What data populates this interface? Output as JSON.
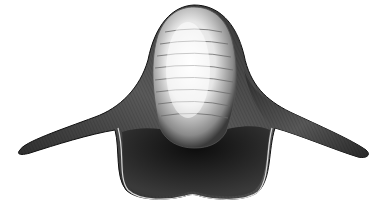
{
  "image": {
    "subject": "engraving of a winged fossil shell",
    "style": "black-and-white engraving",
    "background": "#ffffff",
    "colors": {
      "ink_dark": "#111111",
      "shell_mid": "#4a4a4a",
      "shell_light": "#f2f2f2",
      "aperture": "#1a1a1a"
    },
    "features": {
      "growth_lines": 8,
      "wings": [
        "left",
        "right"
      ]
    }
  }
}
